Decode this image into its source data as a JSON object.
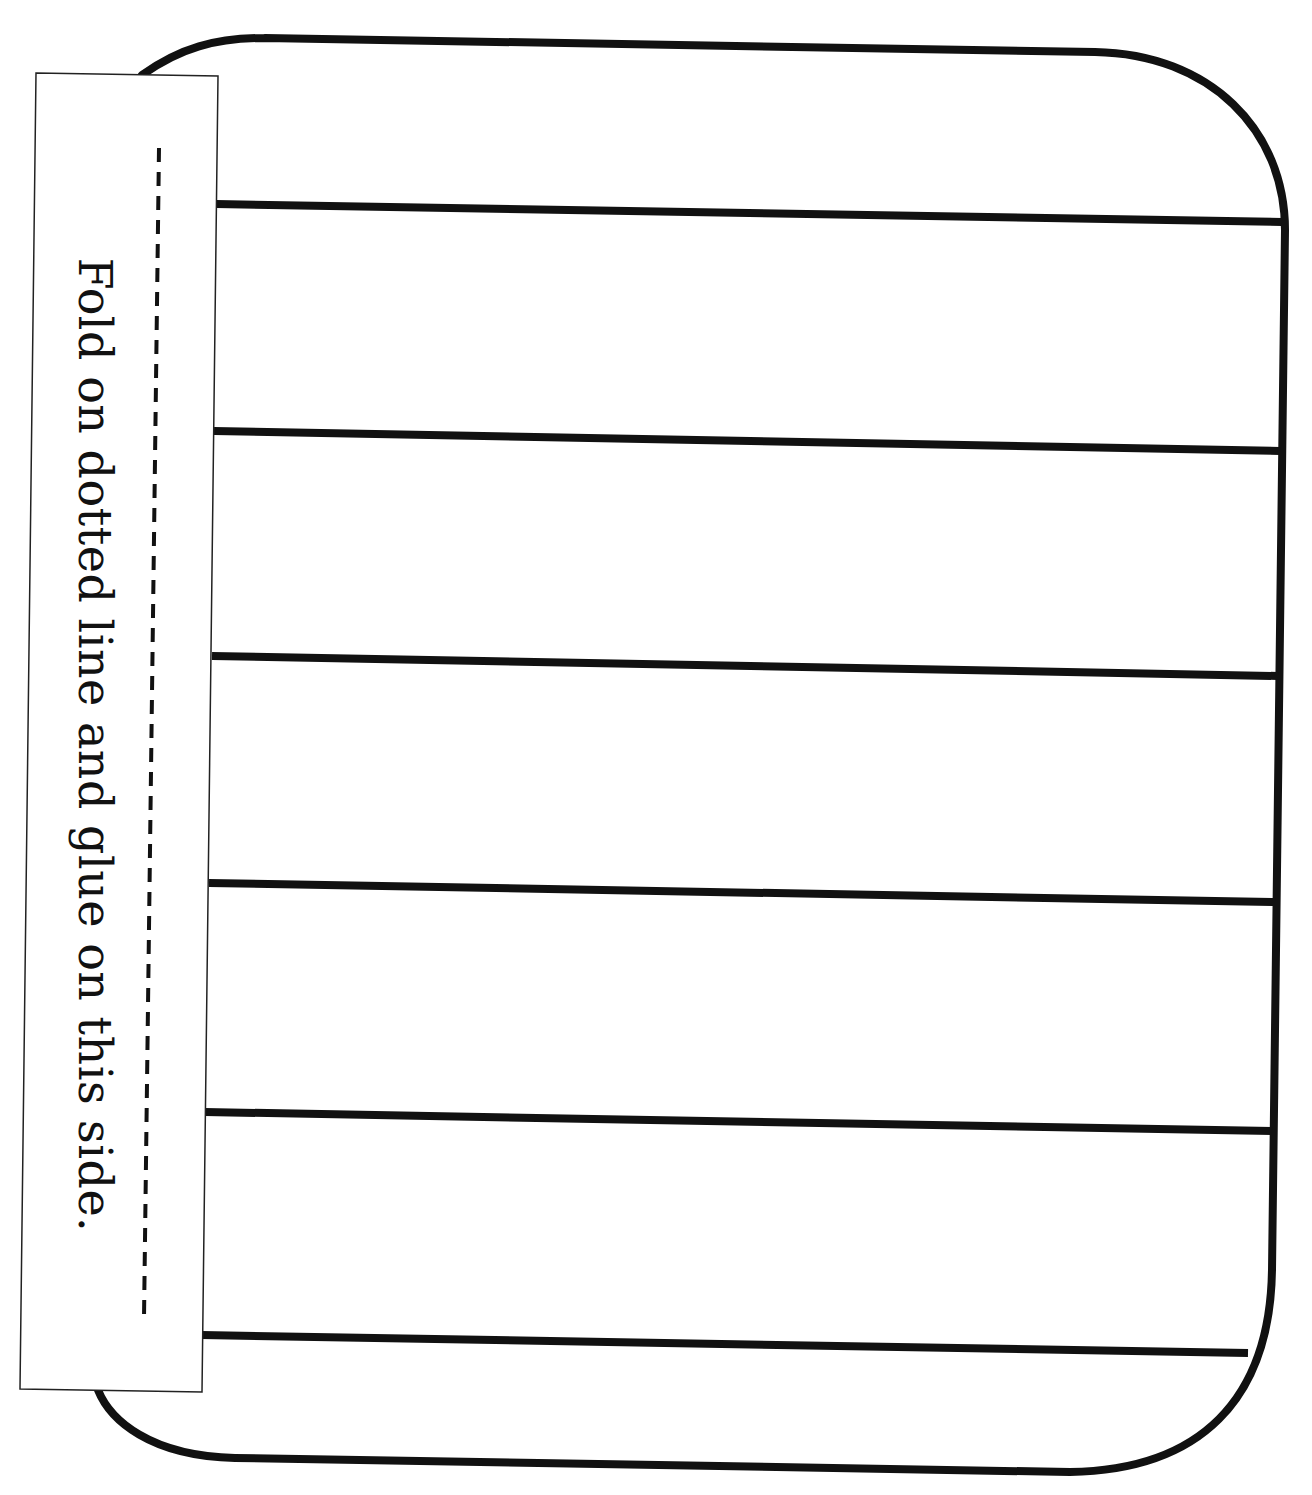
{
  "document": {
    "type": "foldable-flap-template",
    "glue_tab": {
      "instruction": "Fold on dotted line and glue on this side."
    },
    "writing_area": {
      "line_count": 6,
      "rows": [
        {
          "index": 1
        },
        {
          "index": 2
        },
        {
          "index": 3
        },
        {
          "index": 4
        },
        {
          "index": 5
        },
        {
          "index": 6
        },
        {
          "index": 7
        }
      ]
    },
    "colors": {
      "ink": "#111111",
      "paper": "#ffffff"
    }
  }
}
